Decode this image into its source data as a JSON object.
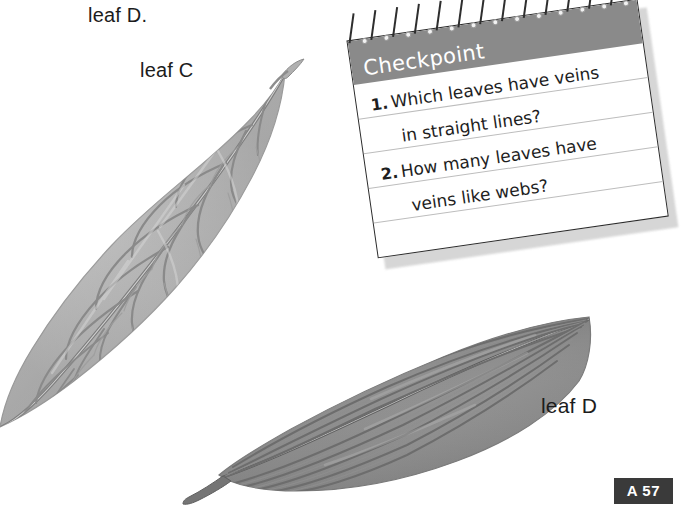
{
  "page": {
    "background_color": "#ffffff",
    "badge": {
      "label": "A 57",
      "background_color": "#3a3a3a",
      "text_color": "#ffffff"
    }
  },
  "labels": {
    "leaf_d_top": "leaf D.",
    "leaf_c": "leaf C",
    "leaf_d": "leaf D"
  },
  "figures": {
    "leaf_c": {
      "name": "leaf C",
      "vein_pattern": "branching veins like webs",
      "fill_color": "#b9b9b9",
      "vein_color": "#8d8d8d"
    },
    "leaf_d": {
      "name": "leaf D",
      "vein_pattern": "veins in straight parallel lines",
      "fill_color": "#8f8f8f",
      "vein_color": "#6b6b6b"
    }
  },
  "checkpoint": {
    "title": "Checkpoint",
    "header_color": "#8a8a8a",
    "card_color": "#ffffff",
    "questions": [
      {
        "number": "1.",
        "line1": "Which leaves have veins",
        "line2": "in straight lines?"
      },
      {
        "number": "2.",
        "line1": "How many leaves have",
        "line2": "veins like webs?"
      }
    ]
  }
}
